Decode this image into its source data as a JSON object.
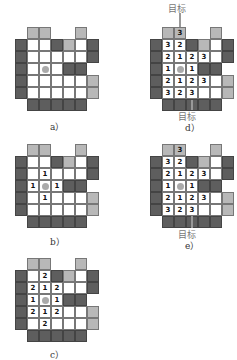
{
  "labels": {
    "a": "a）",
    "b": "b）",
    "c": "c）",
    "d": "d）",
    "e": "e）"
  },
  "target_label": "目标",
  "layout": [
    "ELLEELE",
    "DWWDLWD",
    "DWWWWWD",
    "DWWWDDE",
    "DWWWWWL",
    "DWWWWWL",
    "EDDDDDE"
  ],
  "grids": {
    "a": {
      "x": 15,
      "y": 27,
      "nums": {}
    },
    "b": {
      "x": 15,
      "y": 144,
      "nums": {
        "2,2": "1",
        "3,1": "1",
        "3,3": "1",
        "4,2": "1"
      }
    },
    "c": {
      "x": 15,
      "y": 258,
      "nums": {
        "1,2": "2",
        "2,1": "2",
        "2,2": "1",
        "2,3": "2",
        "3,1": "1",
        "3,3": "1",
        "4,1": "2",
        "4,2": "1",
        "4,3": "2",
        "5,2": "2"
      }
    },
    "d": {
      "x": 150,
      "y": 27,
      "nums": {
        "0,2": "3",
        "1,1": "3",
        "1,2": "2",
        "2,1": "2",
        "2,2": "1",
        "2,3": "2",
        "2,4": "3",
        "3,1": "1",
        "3,3": "1",
        "4,1": "2",
        "4,2": "1",
        "4,3": "2",
        "4,4": "3",
        "5,1": "3",
        "5,2": "2",
        "5,3": "3"
      }
    },
    "e": {
      "x": 150,
      "y": 144,
      "nums": {
        "0,2": "3",
        "1,1": "3",
        "1,2": "2",
        "2,1": "2",
        "2,2": "1",
        "2,3": "2",
        "2,4": "3",
        "3,1": "1",
        "3,3": "1",
        "4,1": "2",
        "4,2": "1",
        "4,3": "2",
        "4,4": "3",
        "5,1": "3",
        "5,2": "2",
        "5,3": "3"
      }
    }
  },
  "dot": {
    "row": 3,
    "col": 2
  }
}
